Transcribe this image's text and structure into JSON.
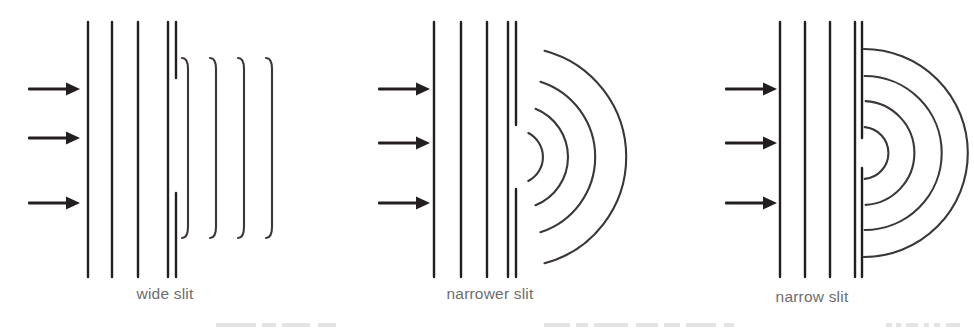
{
  "figure": {
    "title_text": "",
    "width": 974,
    "height": 328,
    "background_color": "#ffffff",
    "stroke_color": "#231f20",
    "caption_color": "#6d6d6d"
  },
  "panels": [
    {
      "id": "wide-slit",
      "caption": "wide slit",
      "origin_x": 0,
      "caption_y": 285,
      "slit_width_px": 115,
      "slit_gap": {
        "top_y": 78,
        "bottom_y": 193
      },
      "barrier_x": [
        168,
        176
      ],
      "barrier_y": [
        22,
        277
      ],
      "incoming_wavefronts_x": [
        88,
        112,
        138
      ],
      "incoming_wavefronts_y": [
        22,
        277
      ],
      "arrows": [
        {
          "x_start": 28,
          "x_end": 78,
          "y": 89
        },
        {
          "x_start": 28,
          "x_end": 78,
          "y": 138
        },
        {
          "x_start": 28,
          "x_end": 78,
          "y": 203
        }
      ],
      "outgoing": {
        "kind": "near-straight-fronts",
        "count": 4,
        "x": [
          188,
          216,
          244,
          272
        ],
        "top_y": 58,
        "bottom_y": 238,
        "end_curl_px": 11
      }
    },
    {
      "id": "narrower-slit",
      "caption": "narrower slit",
      "origin_x": 330,
      "caption_y": 285,
      "slit_width_px": 64,
      "slit_gap": {
        "top_y": 125,
        "bottom_y": 189
      },
      "barrier_x": [
        508,
        516
      ],
      "barrier_y": [
        22,
        277
      ],
      "incoming_wavefronts_x": [
        434,
        461,
        487
      ],
      "incoming_wavefronts_y": [
        22,
        277
      ],
      "arrows": [
        {
          "x_start": 378,
          "x_end": 428,
          "y": 89
        },
        {
          "x_start": 378,
          "x_end": 428,
          "y": 143
        },
        {
          "x_start": 378,
          "x_end": 428,
          "y": 203
        }
      ],
      "outgoing": {
        "kind": "arcs",
        "count": 4,
        "center_x": 516,
        "center_y": 157,
        "radii": [
          27,
          52,
          79,
          110
        ],
        "half_angle_deg": [
          63,
          68,
          72,
          75
        ]
      }
    },
    {
      "id": "narrow-slit",
      "caption": "narrow slit",
      "origin_x": 650,
      "caption_y": 288,
      "slit_width_px": 30,
      "slit_gap": {
        "top_y": 138,
        "bottom_y": 168
      },
      "barrier_x": [
        855,
        862
      ],
      "barrier_y": [
        22,
        277
      ],
      "incoming_wavefronts_x": [
        780,
        805,
        830
      ],
      "incoming_wavefronts_y": [
        22,
        277
      ],
      "arrows": [
        {
          "x_start": 725,
          "x_end": 775,
          "y": 89
        },
        {
          "x_start": 725,
          "x_end": 775,
          "y": 143
        },
        {
          "x_start": 725,
          "x_end": 775,
          "y": 203
        }
      ],
      "outgoing": {
        "kind": "arcs",
        "count": 4,
        "center_x": 862,
        "center_y": 153,
        "radii": [
          26,
          52,
          77,
          104
        ],
        "half_angle_deg": [
          84,
          86,
          88,
          89
        ]
      }
    }
  ],
  "bottom_bleed": {
    "color": "#e3e3e6",
    "marks": [
      {
        "left": 216,
        "width": 40
      },
      {
        "left": 262,
        "width": 14
      },
      {
        "left": 282,
        "width": 28
      },
      {
        "left": 318,
        "width": 18
      },
      {
        "left": 544,
        "width": 26
      },
      {
        "left": 576,
        "width": 12
      },
      {
        "left": 594,
        "width": 34
      },
      {
        "left": 636,
        "width": 22
      },
      {
        "left": 664,
        "width": 16
      },
      {
        "left": 686,
        "width": 30
      },
      {
        "left": 724,
        "width": 10
      },
      {
        "left": 886,
        "width": 6
      },
      {
        "left": 896,
        "width": 5
      },
      {
        "left": 906,
        "width": 12
      },
      {
        "left": 924,
        "width": 5
      },
      {
        "left": 934,
        "width": 6
      },
      {
        "left": 946,
        "width": 14
      }
    ]
  }
}
